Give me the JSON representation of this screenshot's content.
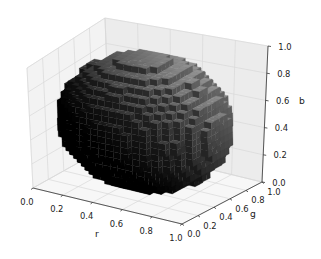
{
  "chart_data": {
    "type": "voxel-3d",
    "title": "",
    "axes": {
      "x": {
        "label": "r",
        "ticks": [
          "0.0",
          "0.2",
          "0.4",
          "0.6",
          "0.8",
          "1.0"
        ],
        "range": [
          0,
          1
        ]
      },
      "y": {
        "label": "g",
        "ticks": [
          "0.0",
          "0.2",
          "0.4",
          "0.6",
          "0.8",
          "1.0"
        ],
        "range": [
          0,
          1
        ]
      },
      "z": {
        "label": "b",
        "ticks": [
          "0.0",
          "0.2",
          "0.4",
          "0.6",
          "0.8",
          "1.0"
        ],
        "range": [
          0,
          1
        ]
      }
    },
    "shape": {
      "kind": "sphere",
      "center": [
        0.5,
        0.5,
        0.5
      ],
      "radius": 0.5
    },
    "grid": true,
    "pane_color": "#f2f2f2",
    "grid_color": "#d8d8d8"
  }
}
